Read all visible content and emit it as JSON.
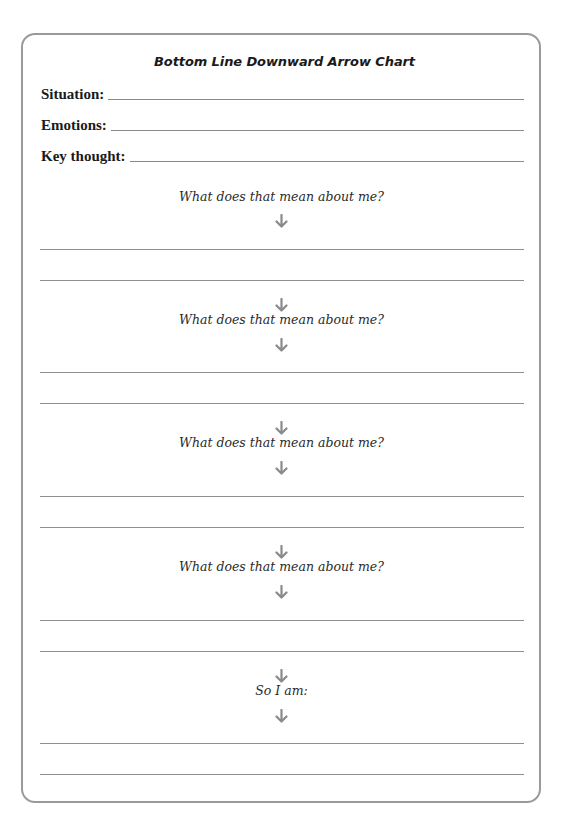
{
  "worksheet": {
    "title": "Bottom Line Downward Arrow Chart",
    "fields": [
      {
        "label": "Situation:",
        "value": ""
      },
      {
        "label": "Emotions:",
        "value": ""
      },
      {
        "label": "Key thought:",
        "value": ""
      }
    ],
    "steps": [
      {
        "prompt": "What does that mean about me?",
        "answer_lines": [
          "",
          ""
        ]
      },
      {
        "prompt": "What does that mean about me?",
        "answer_lines": [
          "",
          ""
        ]
      },
      {
        "prompt": "What does that mean about me?",
        "answer_lines": [
          "",
          ""
        ]
      },
      {
        "prompt": "What does that mean about me?",
        "answer_lines": [
          "",
          ""
        ]
      },
      {
        "prompt": "So I am:",
        "answer_lines": [
          "",
          ""
        ]
      }
    ],
    "icons": {
      "arrow": "down-arrow"
    },
    "colors": {
      "border": "#9a9a9a",
      "line": "#8f8f8f",
      "arrow": "#8a8a8a",
      "text": "#1f1f1f"
    }
  }
}
